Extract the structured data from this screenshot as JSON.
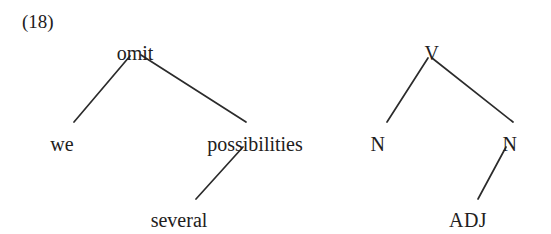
{
  "figure": {
    "example_number": "(18)",
    "background_color": "#ffffff",
    "ink_color": "#222020",
    "edge_color": "#2b2b2b"
  },
  "lexical_tree": {
    "name": "lexical-tree",
    "root": "omit",
    "nodes": [
      {
        "id": "omit",
        "label": "omit",
        "x": 135,
        "y": 43,
        "level": 0
      },
      {
        "id": "we",
        "label": "we",
        "x": 62,
        "y": 134,
        "level": 1
      },
      {
        "id": "possibilities",
        "label": "possibilities",
        "x": 255,
        "y": 134,
        "level": 1
      },
      {
        "id": "several",
        "label": "several",
        "x": 179,
        "y": 210,
        "level": 2
      }
    ],
    "edges": [
      {
        "from": "omit",
        "to": "we",
        "x1": 130,
        "y1": 56,
        "x2": 74,
        "y2": 122
      },
      {
        "from": "omit",
        "to": "possibilities",
        "x1": 141,
        "y1": 55,
        "x2": 246,
        "y2": 122
      },
      {
        "from": "possibilities",
        "to": "several",
        "x1": 243,
        "y1": 147,
        "x2": 196,
        "y2": 199
      }
    ]
  },
  "category_tree": {
    "name": "category-tree",
    "root": "V",
    "nodes": [
      {
        "id": "V",
        "label": "V",
        "x": 432,
        "y": 43,
        "level": 0
      },
      {
        "id": "N1",
        "label": "N",
        "x": 378,
        "y": 134,
        "level": 1
      },
      {
        "id": "N2",
        "label": "N",
        "x": 510,
        "y": 134,
        "level": 1
      },
      {
        "id": "ADJ",
        "label": "ADJ",
        "x": 468,
        "y": 210,
        "level": 2
      }
    ],
    "edges": [
      {
        "from": "V",
        "to": "N1",
        "x1": 428,
        "y1": 58,
        "x2": 387,
        "y2": 122
      },
      {
        "from": "V",
        "to": "N2",
        "x1": 432,
        "y1": 58,
        "x2": 513,
        "y2": 122
      },
      {
        "from": "N2",
        "to": "ADJ",
        "x1": 506,
        "y1": 147,
        "x2": 478,
        "y2": 199
      }
    ]
  }
}
